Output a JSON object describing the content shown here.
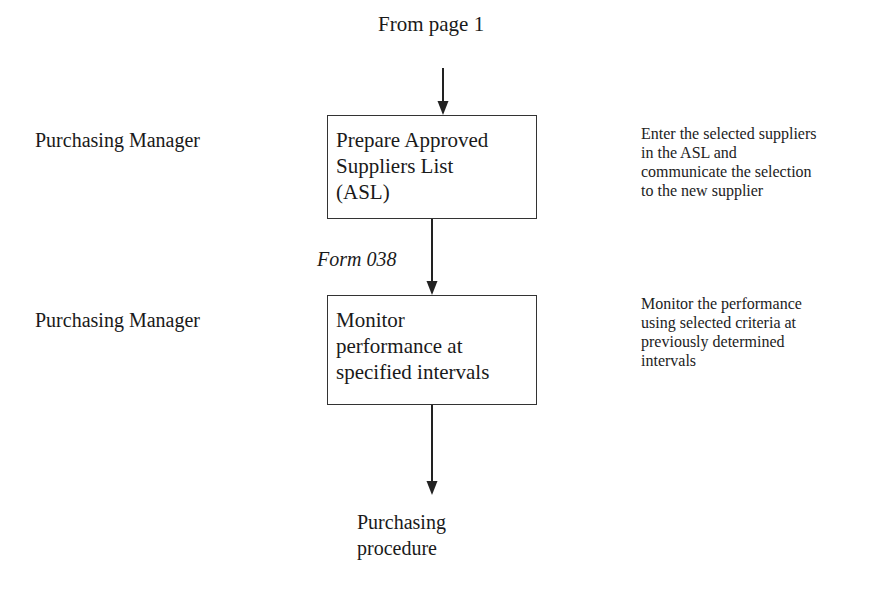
{
  "diagram": {
    "start": {
      "label": "From page 1"
    },
    "roles": [
      {
        "label": "Purchasing Manager"
      },
      {
        "label": "Purchasing Manager"
      }
    ],
    "steps": [
      {
        "lines": [
          "Prepare Approved",
          "Suppliers List",
          "(ASL)"
        ],
        "note_lines": [
          "Enter the selected suppliers",
          "in the ASL and",
          "communicate the selection",
          "to the new supplier"
        ]
      },
      {
        "lines": [
          "Monitor",
          "performance at",
          "specified intervals"
        ],
        "note_lines": [
          "Monitor the performance",
          "using selected criteria at",
          "previously determined",
          "intervals"
        ]
      }
    ],
    "connector_label": "Form 038",
    "end": {
      "lines": [
        "Purchasing",
        "procedure"
      ]
    },
    "colors": {
      "line": "#222222",
      "text": "#1a1a1a",
      "background": "#ffffff"
    }
  }
}
